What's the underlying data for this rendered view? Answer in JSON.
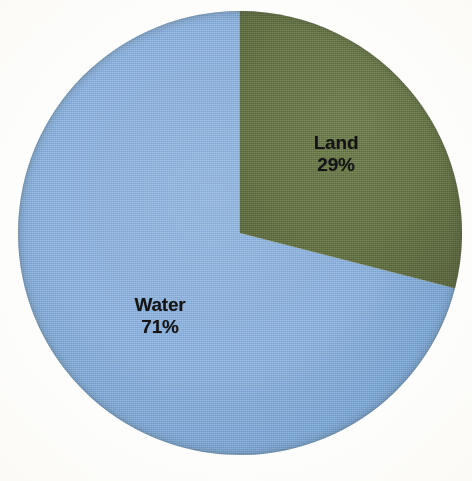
{
  "background_color": "#fefefe",
  "chart_data": {
    "type": "pie",
    "title": "",
    "subtitle": "",
    "xlabel": "",
    "ylabel": "",
    "legend_position": "none",
    "grid": false,
    "total_label": "",
    "units": "percent",
    "start_angle_deg": 0,
    "direction": "clockwise",
    "categories": [
      "Land",
      "Water"
    ],
    "values": [
      29,
      71
    ],
    "value_labels": [
      "29%",
      "71%"
    ],
    "colors": [
      "#5e6b42",
      "#80a8d6"
    ],
    "slices": [
      {
        "name": "Land",
        "value": 29,
        "value_label": "29%",
        "color": "#5e6b42",
        "start_angle_deg": 0,
        "end_angle_deg": 104.4
      },
      {
        "name": "Water",
        "value": 71,
        "value_label": "71%",
        "color": "#80a8d6",
        "start_angle_deg": 104.4,
        "end_angle_deg": 360
      }
    ],
    "annotations": [
      {
        "text": "Land",
        "value_text": "29%",
        "slice": "Land"
      },
      {
        "text": "Water",
        "value_text": "71%",
        "slice": "Water"
      }
    ]
  },
  "geometry": {
    "center_x": 240,
    "center_y": 233,
    "radius": 222
  }
}
